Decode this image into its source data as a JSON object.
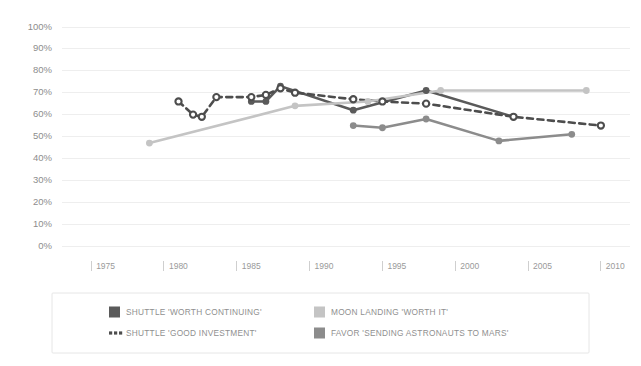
{
  "chart_data": {
    "type": "line",
    "title": "",
    "xlabel": "",
    "ylabel": "",
    "xlim": [
      1973,
      2012
    ],
    "ylim": [
      0,
      100
    ],
    "grid": true,
    "legend_position": "bottom",
    "x_ticks": [
      1975,
      1980,
      1985,
      1990,
      1995,
      2000,
      2005,
      2010
    ],
    "x_tick_labels": [
      "1975",
      "1980",
      "1985",
      "1990",
      "1995",
      "2000",
      "2005",
      "2010"
    ],
    "y_ticks": [
      0,
      10,
      20,
      30,
      40,
      50,
      60,
      70,
      80,
      90,
      100
    ],
    "y_tick_labels": [
      "0%",
      "10%",
      "20%",
      "30%",
      "40%",
      "50%",
      "60%",
      "70%",
      "80%",
      "90%",
      "100%"
    ],
    "series": [
      {
        "name": "SHUTTLE 'WORTH CONTINUING'",
        "key": "shuttle_worth_continuing",
        "color": "#5a5a5a",
        "style": "solid",
        "marker": "filled-circle",
        "points": [
          {
            "x": 1986,
            "y": 66
          },
          {
            "x": 1987,
            "y": 66
          },
          {
            "x": 1988,
            "y": 73
          },
          {
            "x": 1993,
            "y": 62
          },
          {
            "x": 1998,
            "y": 71
          },
          {
            "x": 2004,
            "y": 59
          }
        ]
      },
      {
        "name": "SHUTTLE 'GOOD INVESTMENT'",
        "key": "shuttle_good_investment",
        "color": "#4d4d4d",
        "style": "dashed",
        "marker": "open-circle",
        "points": [
          {
            "x": 1981,
            "y": 66
          },
          {
            "x": 1982,
            "y": 60
          },
          {
            "x": 1982.6,
            "y": 59
          },
          {
            "x": 1983.6,
            "y": 68
          },
          {
            "x": 1986,
            "y": 68
          },
          {
            "x": 1987,
            "y": 69
          },
          {
            "x": 1988,
            "y": 72
          },
          {
            "x": 1989,
            "y": 70
          },
          {
            "x": 1993,
            "y": 67
          },
          {
            "x": 1995,
            "y": 66
          },
          {
            "x": 1998,
            "y": 65
          },
          {
            "x": 2004,
            "y": 59
          },
          {
            "x": 2010,
            "y": 55
          }
        ]
      },
      {
        "name": "MOON LANDING 'WORTH IT'",
        "key": "moon_landing_worth_it",
        "color": "#c4c4c4",
        "style": "solid",
        "marker": "filled-circle",
        "points": [
          {
            "x": 1979,
            "y": 47
          },
          {
            "x": 1989,
            "y": 64
          },
          {
            "x": 1994,
            "y": 66
          },
          {
            "x": 1999,
            "y": 71
          },
          {
            "x": 2009,
            "y": 71
          }
        ]
      },
      {
        "name": "FAVOR 'SENDING ASTRONAUTS TO MARS'",
        "key": "favor_astronauts_to_mars",
        "color": "#8c8c8c",
        "style": "solid",
        "marker": "filled-circle",
        "points": [
          {
            "x": 1993,
            "y": 55
          },
          {
            "x": 1995,
            "y": 54
          },
          {
            "x": 1998,
            "y": 58
          },
          {
            "x": 2003,
            "y": 48
          },
          {
            "x": 2008,
            "y": 51
          }
        ]
      }
    ]
  },
  "legend": {
    "items": [
      {
        "label": "SHUTTLE 'WORTH CONTINUING'",
        "color": "#5a5a5a",
        "swatch": "square"
      },
      {
        "label": "MOON LANDING 'WORTH IT'",
        "color": "#c4c4c4",
        "swatch": "square"
      },
      {
        "label": "SHUTTLE 'GOOD INVESTMENT'",
        "color": "#4d4d4d",
        "swatch": "dashes"
      },
      {
        "label": "FAVOR 'SENDING ASTRONAUTS TO MARS'",
        "color": "#8c8c8c",
        "swatch": "square"
      }
    ]
  },
  "colors": {
    "background": "#ffffff",
    "gridline": "#eeeeee",
    "axis_text": "#8d8d8d",
    "legend_border": "#e6e6e6"
  }
}
